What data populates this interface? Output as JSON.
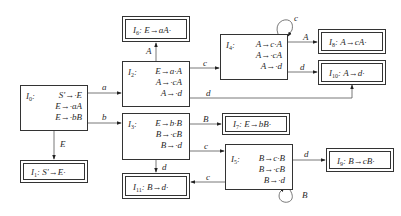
{
  "diagram": {
    "type": "LR(0) item set automaton",
    "states": {
      "I0": {
        "name": "I",
        "sub": "0",
        "items": [
          "S'→·E",
          "E→·aA",
          "E→·bB"
        ],
        "final": false
      },
      "I1": {
        "name": "I",
        "sub": "1",
        "items": [
          "S'→E·"
        ],
        "final": true
      },
      "I2": {
        "name": "I",
        "sub": "2",
        "items": [
          "E→a·A",
          "A→·cA",
          "A→·d"
        ],
        "final": false
      },
      "I3": {
        "name": "I",
        "sub": "3",
        "items": [
          "E→b·B",
          "B→·cB",
          "B→·d"
        ],
        "final": false
      },
      "I4": {
        "name": "I",
        "sub": "4",
        "items": [
          "A→c·A",
          "A→·cA",
          "A→·d"
        ],
        "final": false
      },
      "I5": {
        "name": "I",
        "sub": "5",
        "items": [
          "B→c·B",
          "B→·cB",
          "B→·d"
        ],
        "final": false
      },
      "I6": {
        "name": "I",
        "sub": "6",
        "items": [
          "E→aA·"
        ],
        "final": true
      },
      "I7": {
        "name": "I",
        "sub": "7",
        "items": [
          "E→bB·"
        ],
        "final": true
      },
      "I8": {
        "name": "I",
        "sub": "8",
        "items": [
          "A→cA·"
        ],
        "final": true
      },
      "I9": {
        "name": "I",
        "sub": "9",
        "items": [
          "B→cB·"
        ],
        "final": true
      },
      "I10": {
        "name": "I",
        "sub": "10",
        "items": [
          "A→d·"
        ],
        "final": true
      },
      "I11": {
        "name": "I",
        "sub": "11",
        "items": [
          "B→d·"
        ],
        "final": true
      }
    },
    "edges": [
      {
        "from": "I0",
        "to": "I2",
        "label": "a"
      },
      {
        "from": "I0",
        "to": "I3",
        "label": "b"
      },
      {
        "from": "I0",
        "to": "I1",
        "label": "E"
      },
      {
        "from": "I2",
        "to": "I6",
        "label": "A"
      },
      {
        "from": "I2",
        "to": "I4",
        "label": "c"
      },
      {
        "from": "I2",
        "to": "I10",
        "label": "d"
      },
      {
        "from": "I4",
        "to": "I4",
        "label": "c"
      },
      {
        "from": "I4",
        "to": "I8",
        "label": "A"
      },
      {
        "from": "I4",
        "to": "I10",
        "label": "d"
      },
      {
        "from": "I3",
        "to": "I7",
        "label": "B"
      },
      {
        "from": "I3",
        "to": "I5",
        "label": "c"
      },
      {
        "from": "I3",
        "to": "I11",
        "label": "d"
      },
      {
        "from": "I5",
        "to": "I5",
        "label": "c"
      },
      {
        "from": "I5",
        "to": "I9",
        "label": "B"
      },
      {
        "from": "I5",
        "to": "I11",
        "label": "d"
      }
    ],
    "separator": ":"
  }
}
